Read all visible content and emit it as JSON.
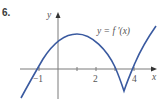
{
  "problem_number": "6.",
  "axes": {
    "x_label": "x",
    "y_label": "y",
    "x_ticks": [
      {
        "value": -1,
        "label": "−1"
      },
      {
        "value": 1,
        "label": ""
      },
      {
        "value": 2,
        "label": "2"
      },
      {
        "value": 3,
        "label": ""
      },
      {
        "value": 4,
        "label": "4"
      }
    ]
  },
  "curve": {
    "label": "y = f ′(x)",
    "color": "#3a5aa0"
  },
  "colors": {
    "axis": "#7a7a7a",
    "curve": "#3a5aa0",
    "text": "#555555"
  }
}
